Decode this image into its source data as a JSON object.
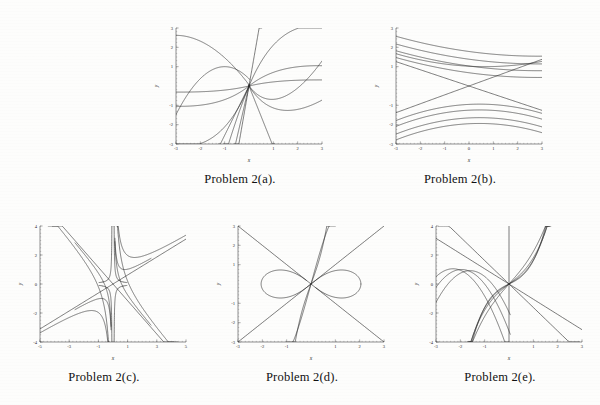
{
  "document": {
    "background_color": "#fdfdfc",
    "ink_color": "#2b2b2b"
  },
  "figures": [
    {
      "id": "a",
      "caption": "Problem 2(a).",
      "xlabel": "x",
      "ylabel": "y",
      "xlim": [
        -3,
        3
      ],
      "ylim": [
        -3,
        3
      ],
      "xticks": [
        -3,
        -2,
        -1,
        1,
        2,
        3
      ],
      "yticks": [
        -3,
        -2,
        -1,
        1,
        2,
        3
      ],
      "xtick_labels": [
        "-3",
        "-2",
        "-1",
        "1",
        "2",
        "3"
      ],
      "ytick_labels": [
        "-3",
        "-2",
        "-1",
        "1",
        "2",
        "3"
      ]
    },
    {
      "id": "b",
      "caption": "Problem 2(b).",
      "xlabel": "x",
      "ylabel": "y",
      "xlim": [
        -3,
        3
      ],
      "ylim": [
        -3,
        3
      ],
      "xticks": [
        -3,
        -2,
        -1,
        0,
        1,
        2,
        3
      ],
      "yticks": [
        -3,
        -2,
        -1,
        1,
        2,
        3
      ],
      "xtick_labels": [
        "-3",
        "-2",
        "-1",
        "0",
        "1",
        "2",
        "3"
      ],
      "ytick_labels": [
        "-3",
        "-2",
        "-1",
        "1",
        "2",
        "3"
      ]
    },
    {
      "id": "c",
      "caption": "Problem 2(c).",
      "xlabel": "x",
      "ylabel": "y",
      "xlim": [
        -5,
        5
      ],
      "ylim": [
        -4,
        4
      ],
      "xticks": [
        -5,
        -3,
        -1,
        1,
        3,
        5
      ],
      "yticks": [
        -4,
        -2,
        0,
        2,
        4
      ],
      "xtick_labels": [
        "-5",
        "-3",
        "-1",
        "1",
        "3",
        "5"
      ],
      "ytick_labels": [
        "-4",
        "-2",
        "0",
        "2",
        "4"
      ]
    },
    {
      "id": "d",
      "caption": "Problem 2(d).",
      "xlabel": "x",
      "ylabel": "y",
      "xlim": [
        -3,
        3
      ],
      "ylim": [
        -3,
        3
      ],
      "xticks": [
        -3,
        -2,
        -1,
        1,
        2,
        3
      ],
      "yticks": [
        -3,
        -2,
        -1,
        1,
        2,
        3
      ],
      "xtick_labels": [
        "-3",
        "-2",
        "-1",
        "1",
        "2",
        "3"
      ],
      "ytick_labels": [
        "-3",
        "-2",
        "-1",
        "1",
        "2",
        "3"
      ]
    },
    {
      "id": "e",
      "caption": "Problem 2(e).",
      "xlabel": "x",
      "ylabel": "y",
      "xlim": [
        -3,
        3
      ],
      "ylim": [
        -4,
        4
      ],
      "xticks": [
        -3,
        -2,
        -1,
        1,
        2,
        3
      ],
      "yticks": [
        -4,
        -2,
        0,
        2,
        4
      ],
      "xtick_labels": [
        "-3",
        "-2",
        "-1",
        "1",
        "2",
        "3"
      ],
      "ytick_labels": [
        "-4",
        "-2",
        "0",
        "2",
        "4"
      ]
    }
  ],
  "chart_data": [
    {
      "type": "line",
      "id": "a",
      "title": "Problem 2(a).",
      "xlabel": "x",
      "ylabel": "y",
      "xlim": [
        -3,
        3
      ],
      "ylim": [
        -3,
        3
      ],
      "grid": false,
      "legend": "none",
      "description": "Family of solution curves all passing through the origin; steep curves near x=0 and flattening branches.",
      "series": [
        {
          "name": "c=-3.0",
          "formula": "cubic-through-origin",
          "c": -3.0
        },
        {
          "name": "c=-1.0",
          "formula": "cubic-through-origin",
          "c": -1.0
        },
        {
          "name": "c=-0.3",
          "formula": "cubic-through-origin",
          "c": -0.3
        },
        {
          "name": "c=0.3",
          "formula": "cubic-through-origin",
          "c": 0.3
        },
        {
          "name": "c=1.0",
          "formula": "cubic-through-origin",
          "c": 1.0
        },
        {
          "name": "c=3.0",
          "formula": "cubic-through-origin",
          "c": 3.0
        }
      ]
    },
    {
      "type": "line",
      "id": "b",
      "title": "Problem 2(b).",
      "xlabel": "x",
      "ylabel": "y",
      "xlim": [
        -3,
        3
      ],
      "ylim": [
        -3,
        3
      ],
      "grid": false,
      "legend": "none",
      "description": "Family of shallow decreasing hyperbolic-like curves in upper and lower half planes, plus two crossing near-straight lines intersecting at the origin.",
      "series": [
        {
          "name": "upper-1",
          "c": 2.3
        },
        {
          "name": "upper-2",
          "c": 1.9
        },
        {
          "name": "upper-3",
          "c": 1.55
        },
        {
          "name": "upper-4",
          "c": 1.2
        },
        {
          "name": "line-down",
          "c": 0.0
        },
        {
          "name": "line-up",
          "c": 0.0
        },
        {
          "name": "lower-1",
          "c": -1.3
        },
        {
          "name": "lower-2",
          "c": -1.6
        },
        {
          "name": "lower-3",
          "c": -2.0
        },
        {
          "name": "lower-4",
          "c": -2.3
        }
      ]
    },
    {
      "type": "line",
      "id": "c",
      "title": "Problem 2(c).",
      "xlabel": "x",
      "ylabel": "y",
      "xlim": [
        -5,
        5
      ],
      "ylim": [
        -4,
        4
      ],
      "grid": false,
      "legend": "none",
      "description": "Two straight asymptote lines through the origin with positive and negative slopes, plus four-branch hyperbola-like curves hugging the asymptotes and a vertical asymptote near x=0.",
      "series": [
        {
          "name": "asymptote-positive",
          "slope": 0.62
        },
        {
          "name": "asymptote-negative",
          "slope": -1.15
        },
        {
          "name": "hyperbola-q1",
          "c": 0.45
        },
        {
          "name": "hyperbola-q2",
          "c": -0.45
        },
        {
          "name": "hyperbola-q3",
          "c": 0.45
        },
        {
          "name": "hyperbola-q4",
          "c": -0.45
        },
        {
          "name": "vertical-branch-left",
          "c": -0.1
        },
        {
          "name": "vertical-branch-right",
          "c": 0.1
        }
      ]
    },
    {
      "type": "line",
      "id": "d",
      "title": "Problem 2(d).",
      "xlabel": "x",
      "ylabel": "y",
      "xlim": [
        -3,
        3
      ],
      "ylim": [
        -3,
        3
      ],
      "grid": false,
      "legend": "none",
      "description": "Lemniscate (figure-eight) centered at origin with horizontal lobes, two straight lines through the origin with slopes +1 and -1, and two steep near-vertical curves crossing at the origin.",
      "series": [
        {
          "name": "lemniscate",
          "a": 2.05
        },
        {
          "name": "line-slope-pos",
          "slope": 1.0
        },
        {
          "name": "line-slope-neg",
          "slope": -1.0
        },
        {
          "name": "steep-left",
          "c": -1.0
        },
        {
          "name": "steep-right",
          "c": 1.0
        }
      ]
    },
    {
      "type": "line",
      "id": "e",
      "title": "Problem 2(e).",
      "xlabel": "x",
      "ylabel": "y",
      "xlim": [
        -3,
        3
      ],
      "ylim": [
        -4,
        4
      ],
      "grid": false,
      "legend": "none",
      "description": "Family of cubic-like curves all passing through the origin with a local max on the left and local min on the right, plus two straight lines of negative slope through the origin and one vertical line at x=0.",
      "series": [
        {
          "name": "cubic-1",
          "c": 0.45
        },
        {
          "name": "cubic-2",
          "c": 0.8
        },
        {
          "name": "cubic-3",
          "c": 1.3
        },
        {
          "name": "cubic-4",
          "c": 2.0
        },
        {
          "name": "line-steep",
          "slope": -1.6
        },
        {
          "name": "line-shallow",
          "slope": -1.0
        },
        {
          "name": "vertical-axis",
          "x": 0
        }
      ]
    }
  ]
}
